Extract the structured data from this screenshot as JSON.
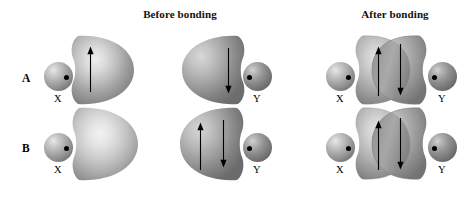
{
  "figure": {
    "kind": "orbital-overlap-diagram",
    "headings": {
      "before": "Before bonding",
      "after": "After bonding"
    },
    "colors": {
      "background": "#ffffff",
      "text": "#000000",
      "lobe_light": "#d9d9d9",
      "lobe_mid": "#a8a8a8",
      "lobe_dark": "#6e6e6e",
      "overlap_dark": "#5a5a5a",
      "sphere_light": "#e8e8e8",
      "sphere_dark": "#5c5c5c",
      "arrow": "#000000"
    }
  },
  "rows": [
    {
      "label": "A",
      "before": {
        "left": {
          "atom_label": "X",
          "electron_dot": true,
          "orbital_arrows": [
            "up"
          ]
        },
        "right": {
          "atom_label": "Y",
          "electron_dot": true,
          "orbital_arrows": [
            "down"
          ]
        }
      },
      "after": {
        "left_atom_label": "X",
        "right_atom_label": "Y",
        "overlap_arrows": [
          "up",
          "down"
        ]
      }
    },
    {
      "label": "B",
      "before": {
        "left": {
          "atom_label": "X",
          "electron_dot": true,
          "orbital_arrows": []
        },
        "right": {
          "atom_label": "Y",
          "electron_dot": true,
          "orbital_arrows": [
            "up",
            "down"
          ]
        }
      },
      "after": {
        "left_atom_label": "X",
        "right_atom_label": "Y",
        "overlap_arrows": [
          "up",
          "down"
        ]
      }
    }
  ],
  "labels": {
    "a_x": "X",
    "a_y": "Y",
    "a_after_x": "X",
    "a_after_y": "Y",
    "b_x": "X",
    "b_y": "Y",
    "b_after_x": "X",
    "b_after_y": "Y"
  }
}
